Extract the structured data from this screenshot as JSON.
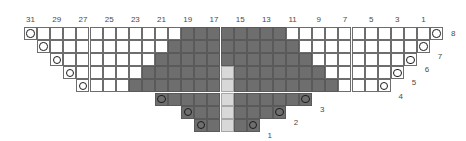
{
  "chart": {
    "type": "knitting-chart",
    "columns_total": 32,
    "rows_total": 8,
    "cell_width": 13.1,
    "cell_height": 13.1,
    "grid_left": 24,
    "grid_top": 27,
    "column_headers": [
      "31",
      "29",
      "27",
      "25",
      "23",
      "21",
      "19",
      "17",
      "15",
      "13",
      "11",
      "9",
      "7",
      "5",
      "3",
      "1"
    ],
    "column_header_numbers": [
      31,
      29,
      27,
      25,
      23,
      21,
      19,
      17,
      15,
      13,
      11,
      9,
      7,
      5,
      3,
      1
    ],
    "row_labels": [
      "1",
      "2",
      "3",
      "4",
      "5",
      "6",
      "7",
      "8"
    ],
    "colors": {
      "background": "#ffffff",
      "plain_stitch": "#ffffff",
      "dark_stitch": "#6e6e6e",
      "center_stitch": "#d8d8d8",
      "grid_line": "#6d6d6d",
      "symbol": "#1c1c1c",
      "label_text": "#4a4a4a"
    },
    "symbols": {
      "yarn_over": "circle",
      "knit_dark": "filled-dark-square",
      "center": "light-square"
    },
    "rows": [
      {
        "label": "8",
        "start_col": 1,
        "end_col": 32,
        "dark_start": 13,
        "dark_end": 20,
        "light_col": null,
        "yo_left_col": 1,
        "yo_right_col": 32
      },
      {
        "label": "7",
        "start_col": 2,
        "end_col": 31,
        "dark_start": 12,
        "dark_end": 21,
        "light_col": null,
        "yo_left_col": 2,
        "yo_right_col": 31
      },
      {
        "label": "6",
        "start_col": 3,
        "end_col": 30,
        "dark_start": 11,
        "dark_end": 22,
        "light_col": null,
        "yo_left_col": 3,
        "yo_right_col": 30
      },
      {
        "label": "5",
        "start_col": 4,
        "end_col": 29,
        "dark_start": 10,
        "dark_end": 23,
        "light_col": 16,
        "yo_left_col": 4,
        "yo_right_col": 29
      },
      {
        "label": "4",
        "start_col": 5,
        "end_col": 28,
        "dark_start": 9,
        "dark_end": 24,
        "light_col": 16,
        "yo_left_col": 5,
        "yo_right_col": 28
      },
      {
        "label": "3",
        "start_col": 11,
        "end_col": 22,
        "dark_start": 11,
        "dark_end": 22,
        "light_col": 16,
        "yo_left_col": 11,
        "yo_right_col": 22
      },
      {
        "label": "2",
        "start_col": 13,
        "end_col": 20,
        "dark_start": 13,
        "dark_end": 20,
        "light_col": 16,
        "yo_left_col": 13,
        "yo_right_col": 20
      },
      {
        "label": "1",
        "start_col": 14,
        "end_col": 18,
        "dark_start": 14,
        "dark_end": 18,
        "light_col": 16,
        "yo_left_col": 14,
        "yo_right_col": 18
      }
    ]
  }
}
